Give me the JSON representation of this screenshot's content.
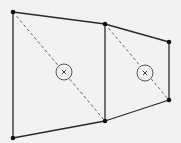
{
  "diagram": {
    "title": "",
    "type": "quadrilateral-mesh",
    "colors": {
      "background": "#f2f2f2",
      "edge": "#2a2a2a",
      "diagonal": "#555555",
      "node": "#111111"
    },
    "nodes": [
      {
        "id": "n1",
        "label": "top-left"
      },
      {
        "id": "n2",
        "label": "top-middle"
      },
      {
        "id": "n3",
        "label": "top-right"
      },
      {
        "id": "n4",
        "label": "bottom-right"
      },
      {
        "id": "n5",
        "label": "bottom-middle"
      },
      {
        "id": "n6",
        "label": "bottom-left"
      }
    ],
    "elements": [
      {
        "id": "e1",
        "label": "left quadrilateral",
        "nodes": [
          "n1",
          "n2",
          "n5",
          "n6"
        ],
        "diagonal": [
          "n1",
          "n5"
        ],
        "centroid_marker": "×"
      },
      {
        "id": "e2",
        "label": "right quadrilateral",
        "nodes": [
          "n2",
          "n3",
          "n4",
          "n5"
        ],
        "diagonal": [
          "n2",
          "n4"
        ],
        "centroid_marker": "×"
      }
    ],
    "edges": [
      [
        "n1",
        "n2"
      ],
      [
        "n2",
        "n3"
      ],
      [
        "n3",
        "n4"
      ],
      [
        "n4",
        "n5"
      ],
      [
        "n5",
        "n6"
      ],
      [
        "n6",
        "n1"
      ],
      [
        "n2",
        "n5"
      ]
    ]
  }
}
